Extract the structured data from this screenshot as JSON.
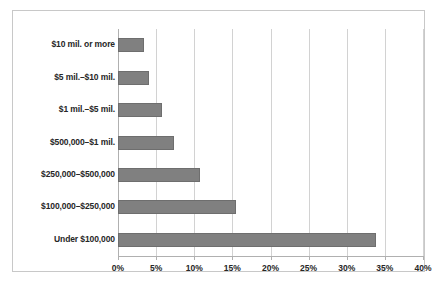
{
  "chart_data": {
    "type": "bar",
    "orientation": "horizontal",
    "title": "",
    "subtitle": "",
    "xlabel": "",
    "ylabel": "",
    "xlim": [
      0,
      40
    ],
    "xtick_labels": [
      "0%",
      "5%",
      "10%",
      "15%",
      "20%",
      "25%",
      "30%",
      "35%",
      "40%"
    ],
    "xtick_values": [
      0,
      5,
      10,
      15,
      20,
      25,
      30,
      35,
      40
    ],
    "grid": true,
    "legend": false,
    "legend_position": "none",
    "categories": [
      "$10 mil. or more",
      "$5 mil.–$10 mil.",
      "$1 mil.–$5 mil.",
      "$500,000–$1 mil.",
      "$250,000–$500,000",
      "$100,000–$250,000",
      "Under $100,000"
    ],
    "values": [
      3.4,
      4.0,
      5.8,
      7.4,
      10.7,
      15.5,
      33.9
    ],
    "value_unit": "percent",
    "bar_color": "#808080",
    "bar_edge_color": "#6e6e6e",
    "gridline_color": "#d2d2d2",
    "axis_color": "#b0b0b0",
    "text_color": "#262626",
    "background_color": "#ffffff",
    "frame_color": "#c8c8c8"
  }
}
